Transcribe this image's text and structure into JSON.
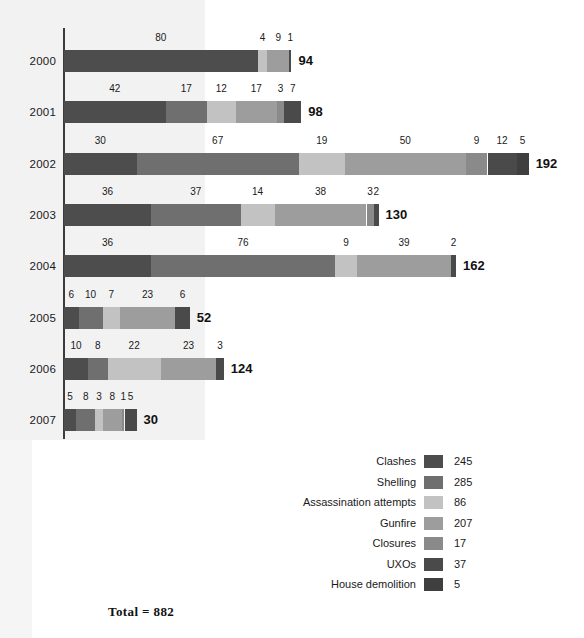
{
  "chart_data": {
    "type": "bar",
    "subtype": "stacked-horizontal-bar",
    "title": "",
    "xlabel": "",
    "ylabel": "",
    "grid": false,
    "legend_position": "bottom-right",
    "categories": [
      "2000",
      "2001",
      "2002",
      "2003",
      "2004",
      "2005",
      "2006",
      "2007"
    ],
    "series": [
      {
        "name": "Clashes",
        "color": "#4d4d4d",
        "total": 245,
        "values": [
          80,
          42,
          30,
          36,
          36,
          6,
          10,
          5
        ]
      },
      {
        "name": "Shelling",
        "color": "#6f6f6f",
        "total": 285,
        "values": [
          0,
          17,
          67,
          37,
          76,
          10,
          8,
          8
        ]
      },
      {
        "name": "Assassination attempts",
        "color": "#c2c2c2",
        "total": 86,
        "values": [
          4,
          12,
          19,
          14,
          9,
          7,
          22,
          3
        ]
      },
      {
        "name": "Gunfire",
        "color": "#9d9d9d",
        "total": 207,
        "values": [
          9,
          17,
          50,
          38,
          39,
          23,
          23,
          8
        ]
      },
      {
        "name": "Closures",
        "color": "#8a8a8a",
        "total": 17,
        "values": [
          0,
          3,
          9,
          3,
          0,
          0,
          0,
          1
        ]
      },
      {
        "name": "UXOs",
        "color": "#4a4a4a",
        "total": 37,
        "values": [
          1,
          7,
          12,
          2,
          2,
          6,
          3,
          5
        ]
      },
      {
        "name": "House demolition",
        "color": "#3f3f3f",
        "total": 5,
        "values": [
          0,
          0,
          5,
          0,
          0,
          0,
          0,
          0
        ]
      }
    ],
    "row_totals": [
      94,
      98,
      192,
      130,
      162,
      52,
      124,
      30
    ],
    "grand_total_label": "Total = 882",
    "grand_total": 882,
    "xlim": [
      0,
      200
    ],
    "px_per_unit": 2.42
  },
  "legend": {
    "items": [
      {
        "label": "Clashes",
        "value": "245"
      },
      {
        "label": "Shelling",
        "value": "285"
      },
      {
        "label": "Assassination attempts",
        "value": "86"
      },
      {
        "label": "Gunfire",
        "value": "207"
      },
      {
        "label": "Closures",
        "value": "17"
      },
      {
        "label": "UXOs",
        "value": "37"
      },
      {
        "label": "House demolition",
        "value": "5"
      }
    ],
    "total_label": "Total = 882"
  }
}
